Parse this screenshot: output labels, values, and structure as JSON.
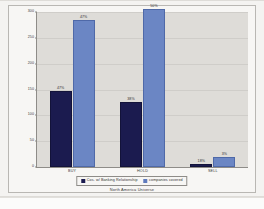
{
  "chart_data": {
    "type": "bar",
    "title": "",
    "xlabel": "North America Universe",
    "ylabel": "",
    "categories": [
      "BUY",
      "HOLD",
      "SELL"
    ],
    "ylim": [
      0,
      300
    ],
    "yticks": [
      0,
      50,
      100,
      150,
      200,
      250,
      300
    ],
    "ytick_labels": [
      "0",
      "50",
      "100",
      "150",
      "200",
      "250",
      "300"
    ],
    "grid": true,
    "legend_position": "bottom",
    "series": [
      {
        "name": "Cos. w/ Banking Relationship",
        "color": "#1b1b4f",
        "values": [
          147,
          125,
          5
        ],
        "data_labels": [
          "47%",
          "38%",
          "18%"
        ]
      },
      {
        "name": "companies covered",
        "color": "#6b86c4",
        "values": [
          285,
          305,
          20
        ],
        "data_labels": [
          "47%",
          "50%",
          "3%"
        ]
      }
    ]
  },
  "legend": {
    "items": [
      {
        "label": "Cos. w/ Banking Relationship",
        "swatch": "legend-swatch-series-1"
      },
      {
        "label": "companies covered",
        "swatch": "legend-swatch-series-2"
      }
    ]
  },
  "axis": {
    "x_title": "North America Universe"
  }
}
